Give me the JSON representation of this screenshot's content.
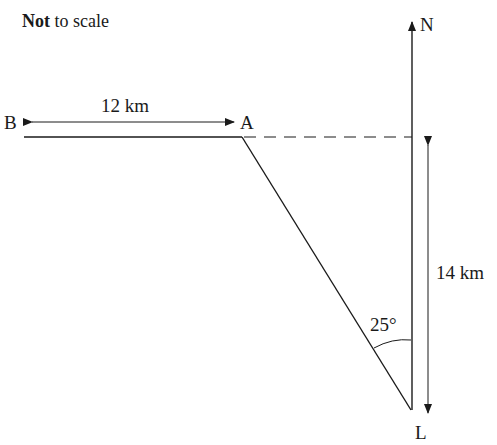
{
  "note": {
    "bold": "Not",
    "rest": " to scale"
  },
  "points": {
    "B": "B",
    "A": "A",
    "N": "N",
    "L": "L"
  },
  "measurements": {
    "BA": "12 km",
    "vertical": "14 km",
    "angle": "25°"
  },
  "colors": {
    "line": "#1a1a1a",
    "background": "#ffffff"
  }
}
